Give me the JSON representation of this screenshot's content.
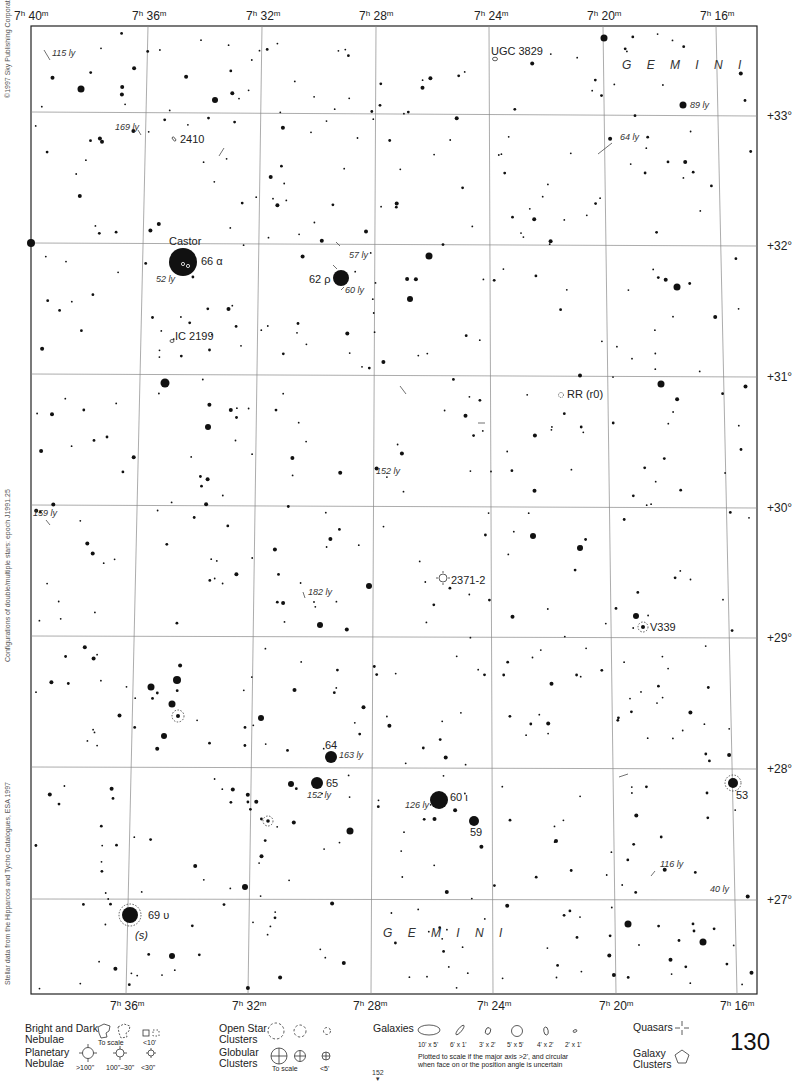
{
  "chart_title": "Gemini star atlas page",
  "page_number": "130",
  "page_ref": {
    "number": "152",
    "arrow": "▼"
  },
  "side_texts": {
    "copyright": "©1997 Sky Publishing Corporation",
    "config": "Configurations of double/multiple stars: epoch J1991.25",
    "source": "Stellar data from the Hipparcos and Tycho Catalogues, ESA 1997"
  },
  "frame": {
    "left": 31,
    "top": 26,
    "right": 757,
    "bottom": 994
  },
  "ra_grid": [
    {
      "label_h": "7",
      "label_m": "40",
      "top_x": 31,
      "bottom_x": 31,
      "label_x_top": 14,
      "show_bottom": false
    },
    {
      "label_h": "7",
      "label_m": "36",
      "top_x": 148,
      "bottom_x": 126,
      "label_x_top": 132,
      "label_x_bottom": 110,
      "show_bottom": true
    },
    {
      "label_h": "7",
      "label_m": "32",
      "top_x": 262,
      "bottom_x": 248,
      "label_x_top": 246,
      "label_x_bottom": 232,
      "show_bottom": true
    },
    {
      "label_h": "7",
      "label_m": "28",
      "top_x": 376,
      "bottom_x": 371,
      "label_x_top": 359,
      "label_x_bottom": 353,
      "show_bottom": true
    },
    {
      "label_h": "7",
      "label_m": "24",
      "top_x": 489,
      "bottom_x": 493,
      "label_x_top": 474,
      "label_x_bottom": 477,
      "show_bottom": true
    },
    {
      "label_h": "7",
      "label_m": "20",
      "top_x": 603,
      "bottom_x": 616,
      "label_x_top": 587,
      "label_x_bottom": 599,
      "show_bottom": true
    },
    {
      "label_h": "7",
      "label_m": "16",
      "top_x": 716,
      "bottom_x": 737,
      "label_x_top": 700,
      "label_x_bottom": 720,
      "show_bottom": true
    }
  ],
  "dec_grid": [
    {
      "label": "+33°",
      "y_left": 112,
      "y_right": 116
    },
    {
      "label": "+32°",
      "y_left": 243,
      "y_right": 246
    },
    {
      "label": "+31°",
      "y_left": 374,
      "y_right": 377
    },
    {
      "label": "+30°",
      "y_left": 505,
      "y_right": 508
    },
    {
      "label": "+29°",
      "y_left": 636,
      "y_right": 638
    },
    {
      "label": "+28°",
      "y_left": 767,
      "y_right": 769
    },
    {
      "label": "+27°",
      "y_left": 899,
      "y_right": 900
    }
  ],
  "constellation_labels": [
    {
      "text": "GEMINI",
      "x": 622,
      "y": 69
    },
    {
      "text": "GEMINI",
      "x": 383,
      "y": 937
    }
  ],
  "named_objects": [
    {
      "name": "Castor",
      "x": 169,
      "y": 245,
      "type": "label"
    },
    {
      "name": "66 α",
      "x": 201,
      "y": 265,
      "type": "star"
    },
    {
      "name": "62 ρ",
      "x": 309,
      "y": 283,
      "type": "star"
    },
    {
      "name": "64",
      "x": 325,
      "y": 749,
      "type": "star"
    },
    {
      "name": "65",
      "x": 326,
      "y": 787,
      "type": "star"
    },
    {
      "name": "60 ι",
      "x": 450,
      "y": 801,
      "type": "star"
    },
    {
      "name": "59",
      "x": 470,
      "y": 836,
      "type": "star"
    },
    {
      "name": "53",
      "x": 736,
      "y": 799,
      "type": "star"
    },
    {
      "name": "69 υ",
      "x": 148,
      "y": 919,
      "type": "star"
    },
    {
      "name": "(s)",
      "x": 135,
      "y": 939,
      "type": "note"
    },
    {
      "name": "V339",
      "x": 650,
      "y": 631,
      "type": "variable"
    },
    {
      "name": "RR (r0)",
      "x": 567,
      "y": 398,
      "type": "variable"
    },
    {
      "name": "UGC 3829",
      "x": 491,
      "y": 55,
      "type": "galaxy"
    },
    {
      "name": "2410",
      "x": 180,
      "y": 143,
      "type": "galaxy"
    },
    {
      "name": "IC 2199",
      "x": 175,
      "y": 340,
      "type": "galaxy"
    },
    {
      "name": "2371-2",
      "x": 451,
      "y": 584,
      "type": "planetary"
    }
  ],
  "distance_labels": [
    {
      "text": "115 ly",
      "x": 52,
      "y": 56
    },
    {
      "text": "169 ly",
      "x": 115,
      "y": 130
    },
    {
      "text": "89 ly",
      "x": 690,
      "y": 108
    },
    {
      "text": "64 ly",
      "x": 620,
      "y": 140
    },
    {
      "text": "52 ly",
      "x": 156,
      "y": 282
    },
    {
      "text": "57 ly",
      "x": 349,
      "y": 258
    },
    {
      "text": "60 ly",
      "x": 345,
      "y": 293
    },
    {
      "text": "152 ly",
      "x": 376,
      "y": 474
    },
    {
      "text": "159 ly",
      "x": 33,
      "y": 516
    },
    {
      "text": "182 ly",
      "x": 308,
      "y": 595
    },
    {
      "text": "163 ly",
      "x": 339,
      "y": 758
    },
    {
      "text": "152 ly",
      "x": 307,
      "y": 798
    },
    {
      "text": "126 ly",
      "x": 405,
      "y": 808
    },
    {
      "text": "116 ly",
      "x": 660,
      "y": 867
    },
    {
      "text": "40 ly",
      "x": 710,
      "y": 892
    }
  ],
  "bright_stars": [
    {
      "x": 183,
      "y": 262,
      "r": 14
    },
    {
      "x": 341,
      "y": 278,
      "r": 8
    },
    {
      "x": 439,
      "y": 800,
      "r": 9
    },
    {
      "x": 130,
      "y": 915,
      "r": 8
    },
    {
      "x": 331,
      "y": 757,
      "r": 6
    },
    {
      "x": 317,
      "y": 783,
      "r": 6
    },
    {
      "x": 474,
      "y": 821,
      "r": 5
    },
    {
      "x": 733,
      "y": 783,
      "r": 5
    },
    {
      "x": 31,
      "y": 243,
      "r": 4
    },
    {
      "x": 165,
      "y": 383,
      "r": 4.5
    },
    {
      "x": 683,
      "y": 105,
      "r": 3.5
    },
    {
      "x": 81,
      "y": 89,
      "r": 3.5
    },
    {
      "x": 604,
      "y": 38,
      "r": 3.5
    },
    {
      "x": 429,
      "y": 256,
      "r": 3.5
    },
    {
      "x": 677,
      "y": 287,
      "r": 3.5
    },
    {
      "x": 661,
      "y": 384,
      "r": 3.5
    },
    {
      "x": 177,
      "y": 680,
      "r": 4
    },
    {
      "x": 151,
      "y": 687,
      "r": 3.5
    },
    {
      "x": 172,
      "y": 704,
      "r": 3.5
    },
    {
      "x": 164,
      "y": 736,
      "r": 3
    },
    {
      "x": 261,
      "y": 718,
      "r": 3
    },
    {
      "x": 350,
      "y": 831,
      "r": 3.5
    },
    {
      "x": 369,
      "y": 586,
      "r": 3
    },
    {
      "x": 636,
      "y": 616,
      "r": 3
    },
    {
      "x": 628,
      "y": 924,
      "r": 3.5
    },
    {
      "x": 703,
      "y": 942,
      "r": 3.5
    },
    {
      "x": 172,
      "y": 956,
      "r": 3
    },
    {
      "x": 410,
      "y": 299,
      "r": 3
    },
    {
      "x": 580,
      "y": 548,
      "r": 3
    },
    {
      "x": 215,
      "y": 100,
      "r": 3
    },
    {
      "x": 320,
      "y": 625,
      "r": 3
    },
    {
      "x": 208,
      "y": 427,
      "r": 3
    },
    {
      "x": 245,
      "y": 887,
      "r": 3
    },
    {
      "x": 533,
      "y": 536,
      "r": 3
    },
    {
      "x": 291,
      "y": 784,
      "r": 3
    }
  ],
  "faint_star_seed": 130,
  "legend": {
    "nebulae": {
      "label": [
        "Bright and Dark",
        "Nebulae"
      ],
      "sub": [
        "To scale",
        "<10'"
      ]
    },
    "planetary": {
      "label": [
        "Planetary",
        "Nebulae"
      ],
      "sub": [
        ">100\"",
        "100\"–30\"",
        "<30\""
      ]
    },
    "open_clusters": {
      "label": [
        "Open Star",
        "Clusters"
      ]
    },
    "globular": {
      "label": [
        "Globular",
        "Clusters"
      ],
      "sub": [
        "To scale",
        "<5'"
      ]
    },
    "galaxies": {
      "label": "Galaxies",
      "sizes": [
        "10' x 5'",
        "6' x 1'",
        "3' x 2'",
        "5' x 5'",
        "4' x 2'",
        "2' x 1'"
      ],
      "note": [
        "Plotted to scale if the major axis >2', and circular",
        "when face on or the position angle is uncertain"
      ]
    },
    "quasars": {
      "label": "Quasars"
    },
    "galaxy_clusters": {
      "label": [
        "Galaxy",
        "Clusters"
      ]
    }
  }
}
